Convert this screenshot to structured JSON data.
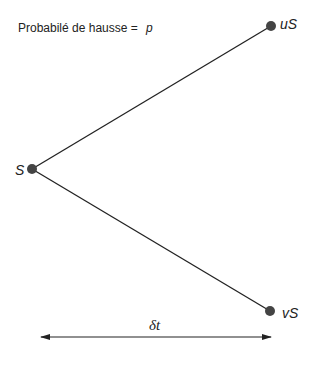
{
  "diagram": {
    "type": "binomial-tree-one-step",
    "probability_label": {
      "text": "Probabilé de hausse  =",
      "symbol": "p"
    },
    "nodes": {
      "start": {
        "label": "S",
        "x": 32,
        "y": 169
      },
      "up": {
        "label": "uS",
        "x": 271,
        "y": 26
      },
      "down": {
        "label": "vS",
        "x": 270,
        "y": 311
      }
    },
    "time_step": {
      "label": "δt"
    },
    "colors": {
      "line": "#222222",
      "node": "#444444",
      "text": "#222222"
    }
  }
}
